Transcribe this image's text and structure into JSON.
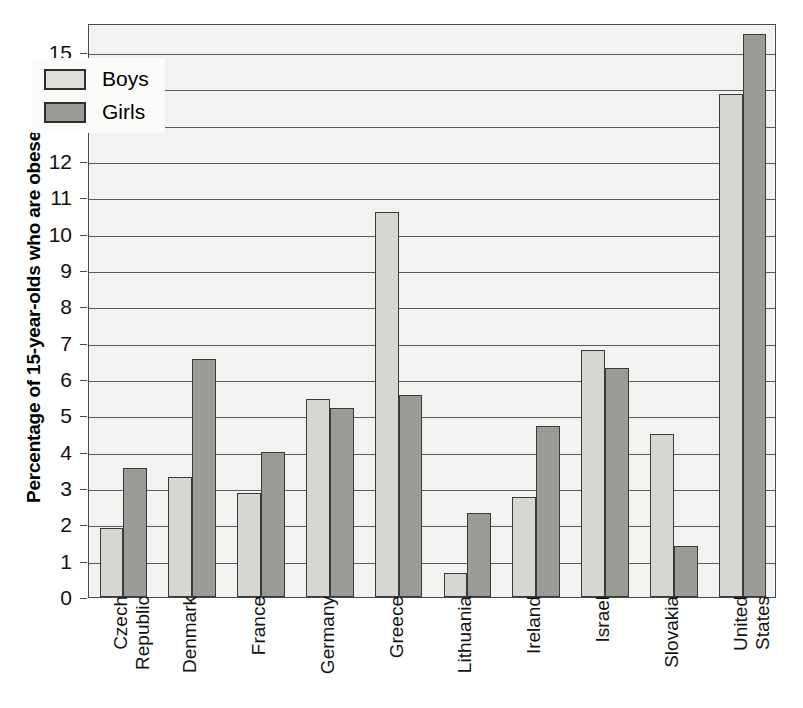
{
  "chart_data": {
    "type": "bar",
    "title": "",
    "xlabel": "",
    "ylabel": "Percentage of 15-year-olds who are obese",
    "ylim": [
      0,
      15.8
    ],
    "yticks": [
      0,
      1,
      2,
      3,
      4,
      5,
      6,
      7,
      8,
      9,
      10,
      11,
      12,
      13,
      14,
      15
    ],
    "grid": true,
    "legend_position": "top-left",
    "categories": [
      "Czech Republic",
      "Denmark",
      "France",
      "Germany",
      "Greece",
      "Lithuania",
      "Ireland",
      "Israel",
      "Slovakia",
      "United States"
    ],
    "category_lines": [
      [
        "Czech",
        "Republic"
      ],
      [
        "Denmark"
      ],
      [
        "France"
      ],
      [
        "Germany"
      ],
      [
        "Greece"
      ],
      [
        "Lithuania"
      ],
      [
        "Ireland"
      ],
      [
        "Israel"
      ],
      [
        "Slovakia"
      ],
      [
        "United",
        "States"
      ]
    ],
    "series": [
      {
        "name": "Boys",
        "color": "#d6d6d2",
        "values": [
          1.9,
          3.3,
          2.85,
          5.45,
          10.6,
          0.65,
          2.75,
          6.8,
          4.5,
          13.85
        ]
      },
      {
        "name": "Girls",
        "color": "#9a9a96",
        "values": [
          3.55,
          6.55,
          4.0,
          5.2,
          5.55,
          2.3,
          4.7,
          6.3,
          1.4,
          15.5
        ]
      }
    ]
  },
  "legend": {
    "items": [
      {
        "label": "Boys",
        "swatch": "boys"
      },
      {
        "label": "Girls",
        "swatch": "girls"
      }
    ]
  }
}
